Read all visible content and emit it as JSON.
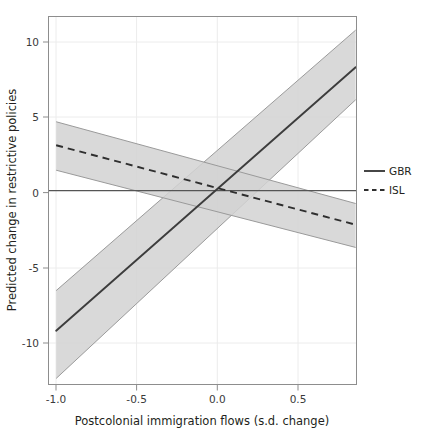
{
  "chart_data": {
    "type": "line",
    "title": "",
    "subtitle": "",
    "xlabel": "Postcolonial immigration flows (s.d. change)",
    "ylabel": "Predicted change in restrictive policies",
    "xlim": [
      -0.965,
      0.845
    ],
    "ylim": [
      -12.8,
      11.5
    ],
    "xticks": [
      -1.0,
      -0.5,
      0.0,
      0.5
    ],
    "xtick_labels": [
      "-1.0",
      "-0.5",
      "0.0",
      "0.5"
    ],
    "yticks": [
      -10,
      -5,
      0,
      5,
      10
    ],
    "ytick_labels": [
      "-10",
      "-5",
      "0",
      "5",
      "10"
    ],
    "grid": true,
    "grid_color": "#e8e8e8",
    "zero_line": 0,
    "legend_position": "right",
    "legend": [
      "GBR",
      "ISL"
    ],
    "band_fill": "#d2d2d2",
    "band_edge": "#8a8a8a",
    "line_color": "#3d3d3d",
    "series": [
      {
        "name": "GBR",
        "style": "solid",
        "x": [
          -0.92,
          0.84
        ],
        "fit": [
          -9.25,
          8.15
        ],
        "ci_lower": [
          -12.4,
          6.0
        ],
        "ci_upper": [
          -6.6,
          10.6
        ]
      },
      {
        "name": "ISL",
        "style": "dashed",
        "x": [
          -0.92,
          0.84
        ],
        "fit": [
          3.0,
          -2.25
        ],
        "ci_lower": [
          1.35,
          -3.75
        ],
        "ci_upper": [
          4.55,
          -0.85
        ]
      }
    ]
  },
  "axes": {
    "x_axis_title": "Postcolonial immigration flows (s.d. change)",
    "y_axis_title": "Predicted change in restrictive policies"
  },
  "legend_items": [
    {
      "label": "GBR",
      "style": "solid"
    },
    {
      "label": "ISL",
      "style": "dashed"
    }
  ]
}
